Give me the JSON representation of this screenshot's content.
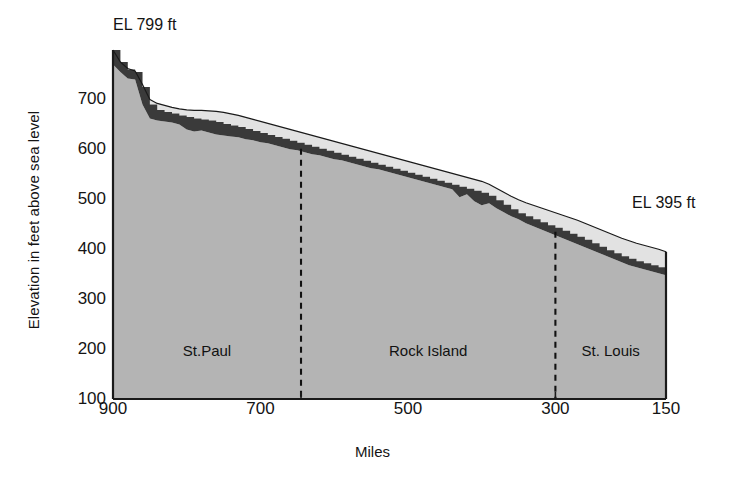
{
  "axes": {
    "y_title": "Elevation in feet above sea level",
    "x_title": "Miles",
    "y_ticks": [
      "700",
      "600",
      "500",
      "400",
      "300",
      "200",
      "100"
    ],
    "x_ticks": [
      "900",
      "700",
      "500",
      "300",
      "150"
    ]
  },
  "annotations": {
    "left": "EL 799 ft",
    "right": "EL 395 ft"
  },
  "regions": [
    {
      "label": "St.Paul"
    },
    {
      "label": "Rock Island"
    },
    {
      "label": "St. Louis"
    }
  ],
  "colors": {
    "body_fill": "#b4b4b4",
    "pool_band": "#3a3a3a",
    "upper_band": "#e2e2e2",
    "outline": "#1a1a1a",
    "divider": "#111111",
    "background": "#ffffff"
  },
  "chart_data": {
    "type": "area",
    "title": "",
    "xlabel": "Miles",
    "ylabel": "Elevation in feet above sea level",
    "xlim": [
      900,
      150
    ],
    "ylim": [
      100,
      799
    ],
    "x_reversed": true,
    "grid": false,
    "legend": null,
    "yticks": [
      700,
      600,
      500,
      400,
      300,
      200,
      100
    ],
    "xticks": [
      900,
      700,
      500,
      300,
      150
    ],
    "endpoint_labels": [
      {
        "text": "EL 799 ft",
        "x": 900,
        "y": 799
      },
      {
        "text": "EL 395 ft",
        "x": 150,
        "y": 395
      }
    ],
    "region_dividers_x": [
      645,
      300
    ],
    "regions": [
      {
        "name": "St.Paul",
        "x_from": 900,
        "x_to": 645
      },
      {
        "name": "Rock Island",
        "x_from": 645,
        "x_to": 300
      },
      {
        "name": "St. Louis",
        "x_from": 300,
        "x_to": 150
      }
    ],
    "series": [
      {
        "name": "Natural river profile (upper envelope)",
        "x": [
          900,
          890,
          880,
          870,
          860,
          850,
          840,
          830,
          820,
          810,
          800,
          790,
          780,
          770,
          760,
          750,
          740,
          730,
          720,
          710,
          700,
          690,
          680,
          670,
          660,
          650,
          640,
          630,
          620,
          610,
          600,
          590,
          580,
          570,
          560,
          550,
          540,
          530,
          520,
          510,
          500,
          490,
          480,
          470,
          460,
          450,
          440,
          430,
          420,
          410,
          400,
          390,
          380,
          370,
          360,
          350,
          340,
          330,
          320,
          310,
          300,
          290,
          280,
          270,
          260,
          250,
          240,
          230,
          220,
          210,
          200,
          190,
          180,
          170,
          160,
          150
        ],
        "y": [
          799,
          775,
          762,
          757,
          730,
          700,
          692,
          688,
          684,
          681,
          679,
          678,
          678,
          677,
          676,
          674,
          671,
          668,
          664,
          660,
          656,
          652,
          648,
          644,
          640,
          636,
          632,
          628,
          624,
          620,
          616,
          612,
          608,
          604,
          600,
          596,
          592,
          588,
          584,
          580,
          576,
          572,
          568,
          564,
          560,
          556,
          552,
          548,
          544,
          540,
          536,
          530,
          522,
          514,
          506,
          499,
          493,
          488,
          483,
          478,
          473,
          468,
          463,
          458,
          452,
          446,
          440,
          434,
          428,
          422,
          417,
          412,
          408,
          404,
          400,
          395
        ]
      },
      {
        "name": "Navigation pool surface (stepped, lock & dam pools)",
        "x": [
          900,
          890,
          880,
          870,
          860,
          850,
          840,
          830,
          820,
          810,
          800,
          790,
          780,
          770,
          760,
          750,
          740,
          730,
          720,
          710,
          700,
          690,
          680,
          670,
          660,
          650,
          640,
          630,
          620,
          610,
          600,
          590,
          580,
          570,
          560,
          550,
          540,
          530,
          520,
          510,
          500,
          490,
          480,
          470,
          460,
          450,
          440,
          430,
          420,
          410,
          400,
          390,
          380,
          370,
          360,
          350,
          340,
          330,
          320,
          310,
          300,
          290,
          280,
          270,
          260,
          250,
          240,
          230,
          220,
          210,
          200,
          190,
          180,
          170,
          160,
          150
        ],
        "y": [
          799,
          775,
          760,
          755,
          725,
          690,
          679,
          675,
          672,
          668,
          665,
          662,
          660,
          658,
          655,
          651,
          648,
          645,
          641,
          637,
          633,
          629,
          625,
          621,
          617,
          613,
          609,
          605,
          601,
          597,
          593,
          589,
          585,
          581,
          577,
          573,
          569,
          565,
          561,
          557,
          553,
          549,
          545,
          541,
          537,
          533,
          529,
          525,
          521,
          517,
          513,
          507,
          498,
          489,
          480,
          472,
          466,
          460,
          454,
          448,
          443,
          437,
          431,
          425,
          419,
          412,
          405,
          398,
          392,
          386,
          381,
          376,
          372,
          368,
          364,
          360
        ]
      },
      {
        "name": "Riverbed / valley floor (base of dark band)",
        "x": [
          900,
          890,
          880,
          870,
          860,
          850,
          840,
          830,
          820,
          810,
          800,
          790,
          780,
          770,
          760,
          750,
          740,
          730,
          720,
          710,
          700,
          690,
          680,
          670,
          660,
          650,
          640,
          630,
          620,
          610,
          600,
          590,
          580,
          570,
          560,
          550,
          540,
          530,
          520,
          510,
          500,
          490,
          480,
          470,
          460,
          450,
          440,
          430,
          420,
          410,
          400,
          390,
          380,
          370,
          360,
          350,
          340,
          330,
          320,
          310,
          300,
          290,
          280,
          270,
          260,
          250,
          240,
          230,
          220,
          210,
          200,
          190,
          180,
          170,
          160,
          150
        ],
        "y": [
          770,
          755,
          742,
          740,
          690,
          662,
          658,
          656,
          654,
          650,
          640,
          636,
          638,
          634,
          630,
          628,
          626,
          624,
          620,
          618,
          614,
          612,
          608,
          604,
          600,
          598,
          594,
          590,
          588,
          584,
          580,
          578,
          574,
          570,
          566,
          562,
          560,
          556,
          552,
          548,
          544,
          540,
          536,
          532,
          528,
          524,
          520,
          504,
          510,
          496,
          488,
          492,
          482,
          474,
          466,
          460,
          452,
          446,
          440,
          434,
          428,
          422,
          416,
          410,
          404,
          398,
          392,
          386,
          380,
          374,
          368,
          364,
          360,
          356,
          352,
          348
        ]
      }
    ]
  }
}
